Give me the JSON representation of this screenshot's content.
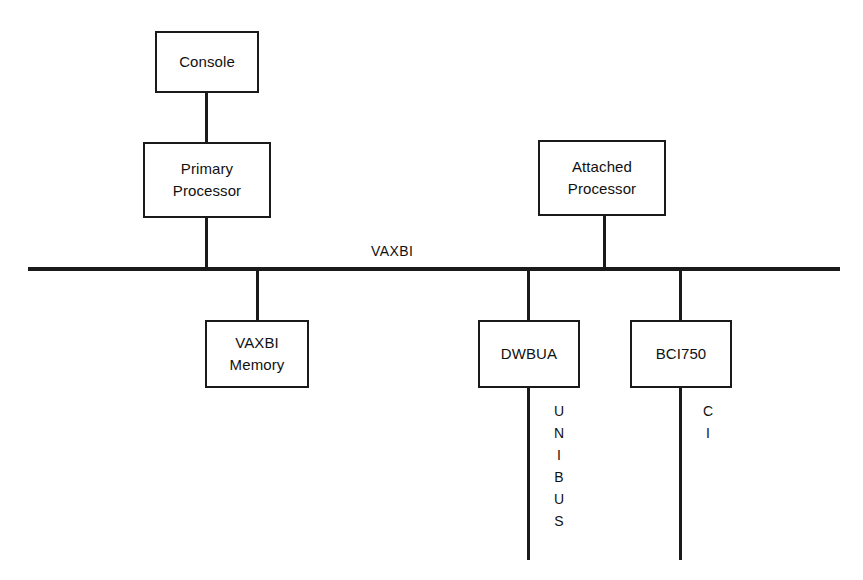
{
  "diagram": {
    "bus": {
      "label": "VAXBI",
      "color": "#1a1a1a"
    },
    "nodes": {
      "console": {
        "label": "Console"
      },
      "primary_processor": {
        "line1": "Primary",
        "line2": "Processor"
      },
      "attached_processor": {
        "line1": "Attached",
        "line2": "Processor"
      },
      "vaxbi_memory": {
        "line1": "VAXBI",
        "line2": "Memory"
      },
      "dwbua": {
        "label": "DWBUA"
      },
      "bci750": {
        "label": "BCI750"
      }
    },
    "bus_labels": {
      "unibus": [
        "U",
        "N",
        "I",
        "B",
        "U",
        "S"
      ],
      "ci": [
        "C",
        "I"
      ]
    }
  }
}
